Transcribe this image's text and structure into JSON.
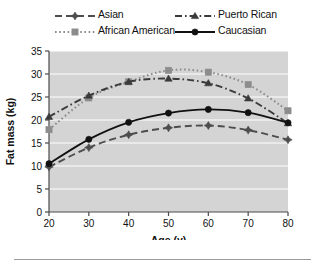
{
  "chart_data": {
    "type": "line",
    "title": "",
    "xlabel": "Age (y)",
    "ylabel": "Fat mass (kg)",
    "x": [
      20,
      30,
      40,
      50,
      60,
      70,
      80
    ],
    "xlim": [
      20,
      80
    ],
    "ylim": [
      0,
      35
    ],
    "xticks": [
      "20",
      "30",
      "40",
      "50",
      "60",
      "70",
      "80"
    ],
    "yticks": [
      "0",
      "5",
      "10",
      "15",
      "20",
      "25",
      "30",
      "35"
    ],
    "grid": "horizontal-white",
    "legend_position": "above-plot",
    "plot_background": "#d4d4d4",
    "series": [
      {
        "name": "Asian",
        "values": [
          9.8,
          14.0,
          16.8,
          18.3,
          18.8,
          17.8,
          15.7
        ],
        "color": "#4d4d4d",
        "linestyle": "dashed",
        "marker": "diamond"
      },
      {
        "name": "African American",
        "values": [
          17.9,
          24.8,
          28.3,
          30.8,
          30.4,
          27.7,
          22.0
        ],
        "color": "#8c8c8c",
        "linestyle": "dotted",
        "marker": "square"
      },
      {
        "name": "Puerto Rican",
        "values": [
          20.7,
          25.3,
          28.3,
          29.0,
          28.0,
          24.7,
          19.3
        ],
        "color": "#3a3a3a",
        "linestyle": "dashdot",
        "marker": "triangle"
      },
      {
        "name": "Caucasian",
        "values": [
          10.5,
          15.8,
          19.5,
          21.5,
          22.3,
          21.6,
          19.4
        ],
        "color": "#111111",
        "linestyle": "solid",
        "marker": "circle"
      }
    ]
  },
  "legend": {
    "items": [
      {
        "label": "Asian",
        "series_index": 0
      },
      {
        "label": "Puerto Rican",
        "series_index": 2
      },
      {
        "label": "African American",
        "series_index": 1
      },
      {
        "label": "Caucasian",
        "series_index": 3
      }
    ]
  }
}
